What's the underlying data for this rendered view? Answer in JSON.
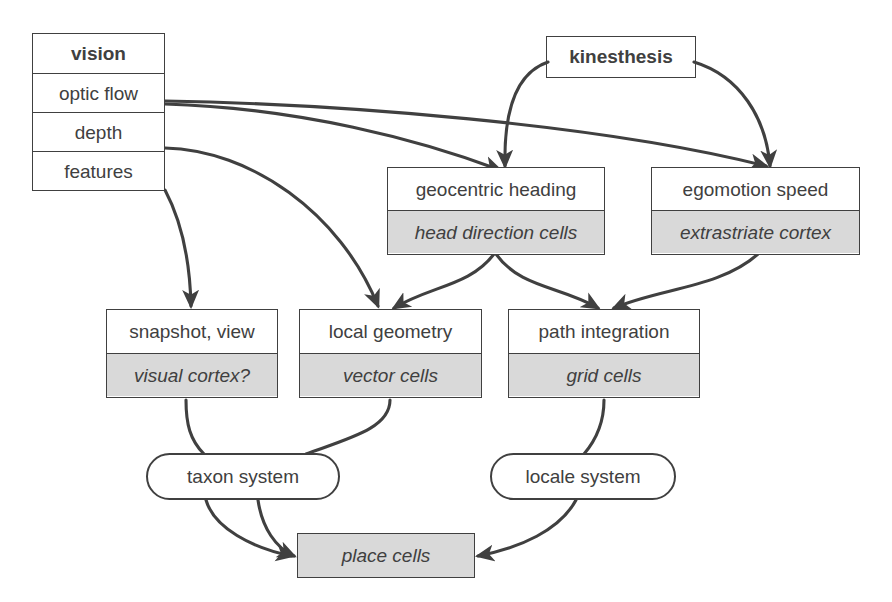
{
  "diagram": {
    "stroke_color": "#404040",
    "gray_fill": "#d9d9d9",
    "white_fill": "#ffffff"
  },
  "nodes": {
    "vision": {
      "rows": [
        {
          "label": "vision",
          "style": "bold"
        },
        {
          "label": "optic flow",
          "style": "plain"
        },
        {
          "label": "depth",
          "style": "plain"
        },
        {
          "label": "features",
          "style": "plain"
        }
      ]
    },
    "kinesthesis": {
      "label": "kinesthesis"
    },
    "geocentric_heading": {
      "title": "geocentric heading",
      "substrate": "head direction cells"
    },
    "egomotion_speed": {
      "title": "egomotion speed",
      "substrate": "extrastriate cortex"
    },
    "snapshot_view": {
      "title": "snapshot, view",
      "substrate": "visual cortex?"
    },
    "local_geometry": {
      "title": "local geometry",
      "substrate": "vector cells"
    },
    "path_integration": {
      "title": "path integration",
      "substrate": "grid cells"
    },
    "taxon_system": {
      "label": "taxon system"
    },
    "locale_system": {
      "label": "locale system"
    },
    "place_cells": {
      "label": "place cells"
    }
  },
  "edges": [
    {
      "from": "optic flow",
      "to": "geocentric heading",
      "arrow": true
    },
    {
      "from": "optic flow",
      "to": "egomotion speed",
      "arrow": true
    },
    {
      "from": "kinesthesis",
      "to": "geocentric heading",
      "arrow": true
    },
    {
      "from": "kinesthesis",
      "to": "egomotion speed",
      "arrow": true
    },
    {
      "from": "depth",
      "to": "local geometry",
      "arrow": true
    },
    {
      "from": "features",
      "to": "snapshot, view",
      "arrow": true
    },
    {
      "from": "geocentric heading",
      "to": "local geometry",
      "arrow": true
    },
    {
      "from": "geocentric heading",
      "to": "path integration",
      "arrow": true
    },
    {
      "from": "egomotion speed",
      "to": "path integration",
      "arrow": true
    },
    {
      "from": "snapshot, view",
      "to": "taxon system",
      "arrow": false
    },
    {
      "from": "local geometry",
      "to": "taxon system",
      "arrow": false
    },
    {
      "from": "path integration",
      "to": "locale system",
      "arrow": false
    },
    {
      "from": "taxon system",
      "to": "place cells",
      "arrow": true
    },
    {
      "from": "taxon system",
      "to": "place cells",
      "arrow": true
    },
    {
      "from": "locale system",
      "to": "place cells",
      "arrow": true
    }
  ]
}
